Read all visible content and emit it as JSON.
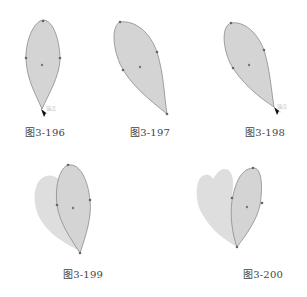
{
  "figures": [
    {
      "id": "3-196",
      "caption": "图3-196",
      "tip_label": "锚点",
      "description": "Teardrop petal, anchor point selected at bottom tip with cursor"
    },
    {
      "id": "3-197",
      "caption": "图3-197",
      "description": "Petal rotated and reshaped"
    },
    {
      "id": "3-198",
      "caption": "图3-198",
      "tip_label": "锚点",
      "description": "Rotated petal with cursor at bottom anchor"
    },
    {
      "id": "3-199",
      "caption": "图3-199",
      "description": "Petal with duplicated shadow petal behind"
    },
    {
      "id": "3-200",
      "caption": "图3-200",
      "description": "Two petals forming heart-like shape"
    }
  ],
  "colors": {
    "petal_fill": "#d4d4d4",
    "petal_stroke": "#8a8a8a",
    "shadow_fill": "#dedede",
    "anchor": "#666666",
    "cursor": "#111111"
  }
}
